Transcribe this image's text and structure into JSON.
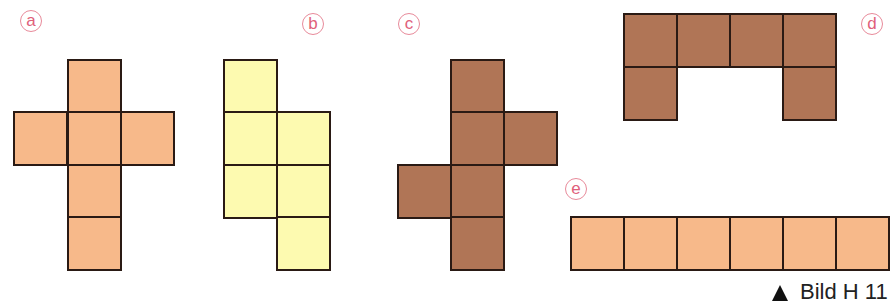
{
  "figure": {
    "caption": "Bild H 11",
    "caption_marker": "triangle-up",
    "square_size": 53,
    "colors": {
      "orange": "#f7b98a",
      "yellow": "#fdfab0",
      "brown": "#b07556",
      "outline": "#2a1a14",
      "label": "#e0607a"
    },
    "nets": [
      {
        "id": "a",
        "label": "a",
        "color": "orange",
        "label_pos": [
          20,
          10
        ],
        "squares": [
          [
            68,
            60
          ],
          [
            14,
            112
          ],
          [
            68,
            112
          ],
          [
            121,
            112
          ],
          [
            68,
            165
          ],
          [
            68,
            217
          ]
        ]
      },
      {
        "id": "b",
        "label": "b",
        "color": "yellow",
        "label_pos": [
          302,
          13
        ],
        "squares": [
          [
            224,
            60
          ],
          [
            224,
            112
          ],
          [
            277,
            112
          ],
          [
            224,
            165
          ],
          [
            277,
            165
          ],
          [
            277,
            217
          ]
        ]
      },
      {
        "id": "c",
        "label": "c",
        "color": "brown",
        "label_pos": [
          398,
          13
        ],
        "squares": [
          [
            451,
            60
          ],
          [
            451,
            112
          ],
          [
            504,
            112
          ],
          [
            398,
            165
          ],
          [
            451,
            165
          ],
          [
            451,
            217
          ]
        ]
      },
      {
        "id": "d",
        "label": "d",
        "color": "brown",
        "label_pos": [
          861,
          13
        ],
        "squares": [
          [
            624,
            14
          ],
          [
            677,
            14
          ],
          [
            730,
            14
          ],
          [
            783,
            14
          ],
          [
            624,
            67
          ],
          [
            783,
            67
          ]
        ]
      },
      {
        "id": "e",
        "label": "e",
        "color": "orange",
        "label_pos": [
          565,
          178
        ],
        "squares": [
          [
            571,
            217
          ],
          [
            624,
            217
          ],
          [
            677,
            217
          ],
          [
            730,
            217
          ],
          [
            783,
            217
          ],
          [
            836,
            217
          ]
        ]
      }
    ]
  }
}
